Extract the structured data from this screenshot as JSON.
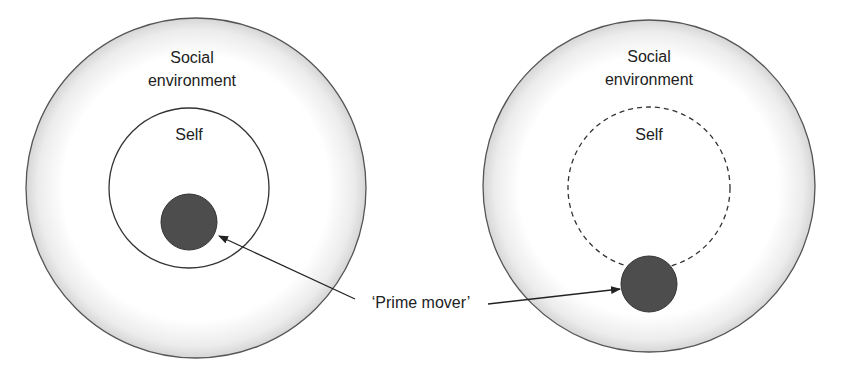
{
  "diagram": {
    "left": {
      "outer_label_line1": "Social",
      "outer_label_line2": "environment",
      "inner_label": "Self",
      "inner_boundary": "solid"
    },
    "right": {
      "outer_label_line1": "Social",
      "outer_label_line2": "environment",
      "inner_label": "Self",
      "inner_boundary": "dashed"
    },
    "shared_label": "‘Prime mover’",
    "colors": {
      "outer_edge": "#d9d9d9",
      "outline": "#555555",
      "prime_mover_fill": "#4d4d4d",
      "arrow": "#222222"
    }
  }
}
